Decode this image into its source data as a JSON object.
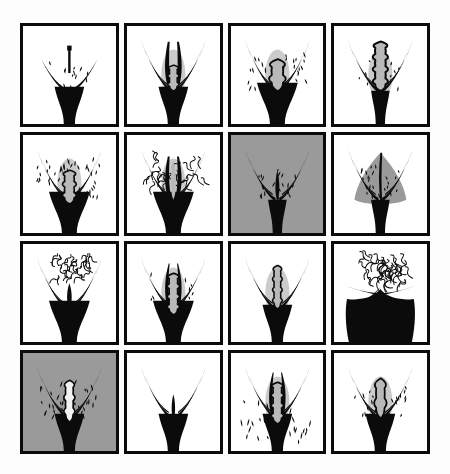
{
  "plate": {
    "title": "Grid of sixteen framed pen-and-ink illustrations",
    "layout": {
      "rows": 4,
      "columns": 4,
      "cell_count": 16
    },
    "page_background": "#fdfdfd",
    "frame_color": "#0b0b0b",
    "frame_thickness_px": 3,
    "ink_color": "#0b0b0b",
    "gray_tone": "#9a9a9a",
    "mid_gray": "#b9b9b9",
    "white": "#ffffff"
  },
  "panels": [
    {
      "index": 1,
      "position": "row-1-col-1",
      "background": "#ffffff",
      "background_name": "white",
      "texture": "sparse-stipple",
      "form": "narrow-vertical-stem-with-wide-wings",
      "has_dark_mass": true,
      "dark_mass_scale": "medium",
      "stipple_count": 14
    },
    {
      "index": 2,
      "position": "row-1-col-2",
      "background": "#ffffff",
      "background_name": "white",
      "texture": "none",
      "form": "tall-double-blade-with-central-bud",
      "has_dark_mass": true,
      "dark_mass_scale": "medium",
      "stipple_count": 0
    },
    {
      "index": 3,
      "position": "row-1-col-3",
      "background": "#ffffff",
      "background_name": "white",
      "texture": "dense-stipple",
      "form": "rounded-central-bud-with-swept-wings",
      "has_dark_mass": true,
      "dark_mass_scale": "large",
      "stipple_count": 30
    },
    {
      "index": 4,
      "position": "row-1-col-4",
      "background": "#ffffff",
      "background_name": "white",
      "texture": "fine-stipple",
      "form": "elongated-lobed-column",
      "has_dark_mass": true,
      "dark_mass_scale": "small",
      "stipple_count": 16
    },
    {
      "index": 5,
      "position": "row-2-col-1",
      "background": "#ffffff",
      "background_name": "white",
      "texture": "heavy-teardrop-stipple",
      "form": "broad-wings-with-folded-center",
      "has_dark_mass": true,
      "dark_mass_scale": "large",
      "stipple_count": 46
    },
    {
      "index": 6,
      "position": "row-2-col-2",
      "background": "#ffffff",
      "background_name": "white",
      "texture": "curly-squiggle",
      "form": "tall-slit-with-curled-texture",
      "has_dark_mass": true,
      "dark_mass_scale": "large",
      "stipple_count": 26
    },
    {
      "index": 7,
      "position": "row-2-col-3",
      "background": "#9a9a9a",
      "background_name": "gray",
      "texture": "sparse-stipple",
      "form": "slim-symmetric-v-with-thin-wings",
      "has_dark_mass": true,
      "dark_mass_scale": "small",
      "stipple_count": 22
    },
    {
      "index": 8,
      "position": "row-2-col-4",
      "background": "#ffffff",
      "background_name": "white-with-gray-field",
      "texture": "stipple-on-gray-field",
      "form": "fan-shaped-gray-triangle",
      "has_dark_mass": true,
      "dark_mass_scale": "small",
      "stipple_count": 24
    },
    {
      "index": 9,
      "position": "row-3-col-1",
      "background": "#ffffff",
      "background_name": "white",
      "texture": "top-cluster-squiggle",
      "form": "smooth-narrow-column",
      "has_dark_mass": true,
      "dark_mass_scale": "large",
      "stipple_count": 34
    },
    {
      "index": 10,
      "position": "row-3-col-2",
      "background": "#ffffff",
      "background_name": "white",
      "texture": "light-stipple",
      "form": "flame-like-multi-lobe",
      "has_dark_mass": true,
      "dark_mass_scale": "large",
      "stipple_count": 18
    },
    {
      "index": 11,
      "position": "row-3-col-3",
      "background": "#ffffff",
      "background_name": "white",
      "texture": "none",
      "form": "narrow-ribbed-central-shaft",
      "has_dark_mass": true,
      "dark_mass_scale": "medium",
      "stipple_count": 0
    },
    {
      "index": 12,
      "position": "row-3-col-4",
      "background": "#ffffff",
      "background_name": "white",
      "texture": "top-burst-hatching",
      "form": "wide-solid-black-mass-with-twin-crest",
      "has_dark_mass": true,
      "dark_mass_scale": "very-large",
      "stipple_count": 44
    },
    {
      "index": 13,
      "position": "row-4-col-1",
      "background": "#9a9a9a",
      "background_name": "gray",
      "texture": "dense-stipple",
      "form": "pale-central-slit-with-wings",
      "has_dark_mass": true,
      "dark_mass_scale": "medium",
      "stipple_count": 40
    },
    {
      "index": 14,
      "position": "row-4-col-2",
      "background": "#ffffff",
      "background_name": "white",
      "texture": "none",
      "form": "plain-smooth-v-form",
      "has_dark_mass": true,
      "dark_mass_scale": "medium",
      "stipple_count": 0
    },
    {
      "index": 15,
      "position": "row-4-col-3",
      "background": "#ffffff",
      "background_name": "white",
      "texture": "scattered-dash-stipple",
      "form": "flame-like-multi-lobe",
      "has_dark_mass": true,
      "dark_mass_scale": "medium",
      "stipple_count": 28
    },
    {
      "index": 16,
      "position": "row-4-col-4",
      "background": "#ffffff",
      "background_name": "white",
      "texture": "medium-stipple",
      "form": "bulbous-tip-column",
      "has_dark_mass": true,
      "dark_mass_scale": "medium",
      "stipple_count": 30
    }
  ]
}
